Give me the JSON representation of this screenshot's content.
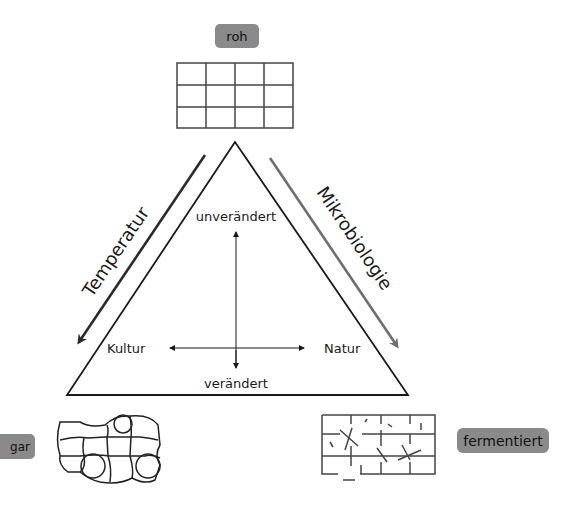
{
  "diagram": {
    "type": "culinary-triangle",
    "top": {
      "badge": "roh"
    },
    "bottom_left": {
      "badge": "gar"
    },
    "bottom_right": {
      "badge": "fermentiert"
    },
    "edges": {
      "left": "Temperatur",
      "right": "Mikrobiologie"
    },
    "axes": {
      "top": "unverändert",
      "bottom": "verändert",
      "left": "Kultur",
      "right": "Natur"
    },
    "colors": {
      "badge_fill": "#8a8a8a",
      "line": "#1a1a1a",
      "left_arrow": "#2a2a2a",
      "right_arrow": "#6e6e6e"
    }
  }
}
